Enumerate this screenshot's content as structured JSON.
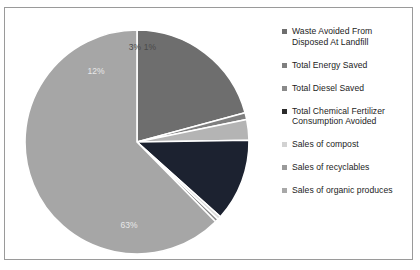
{
  "chart_data": {
    "type": "pie",
    "title": "",
    "legend_position": "right",
    "categories": [
      "Waste Avoided From Disposed At Landfill",
      "Total Energy Saved",
      "Total Diesel Saved",
      "Total Chemical Fertilizer Consumption Avoided",
      "Sales of compost",
      "Sales of recyclables",
      "Sales of organic produces"
    ],
    "values": [
      21,
      1,
      3,
      12,
      0.5,
      0.5,
      63
    ],
    "value_labels": [
      "",
      "1%",
      "3%",
      "12%",
      "",
      "",
      "63%"
    ],
    "colors": [
      "#6e6e6e",
      "#7f7f7f",
      "#b4b4b4",
      "#1c2230",
      "#dcdcdc",
      "#8c8c8c",
      "#a6a6a6"
    ],
    "slice_label_texts": [
      {
        "text": "1%",
        "x": 131,
        "y": 34,
        "tone": "dark"
      },
      {
        "text": "3%",
        "x": 116,
        "y": 34,
        "tone": "dark"
      },
      {
        "text": "12%",
        "x": 77,
        "y": 58,
        "tone": "light"
      },
      {
        "text": "63%",
        "x": 110,
        "y": 212,
        "tone": "light"
      }
    ],
    "xlabel": "",
    "ylabel": ""
  },
  "legend": {
    "items": [
      {
        "label": "Waste Avoided From Disposed At Landfill",
        "color": "#6e6e6e"
      },
      {
        "label": "Total Energy Saved",
        "color": "#7f7f7f"
      },
      {
        "label": "Total Diesel Saved",
        "color": "#8a8a8a"
      },
      {
        "label": "Total Chemical Fertilizer Consumption Avoided",
        "color": "#2b2b2b"
      },
      {
        "label": "Sales of compost",
        "color": "#d2d2d2"
      },
      {
        "label": "Sales of recyclables",
        "color": "#9a9a9a"
      },
      {
        "label": "Sales of organic produces",
        "color": "#a8a8a8"
      }
    ]
  },
  "frame": {
    "border_color": "#9a9a9a",
    "background": "#ffffff"
  }
}
